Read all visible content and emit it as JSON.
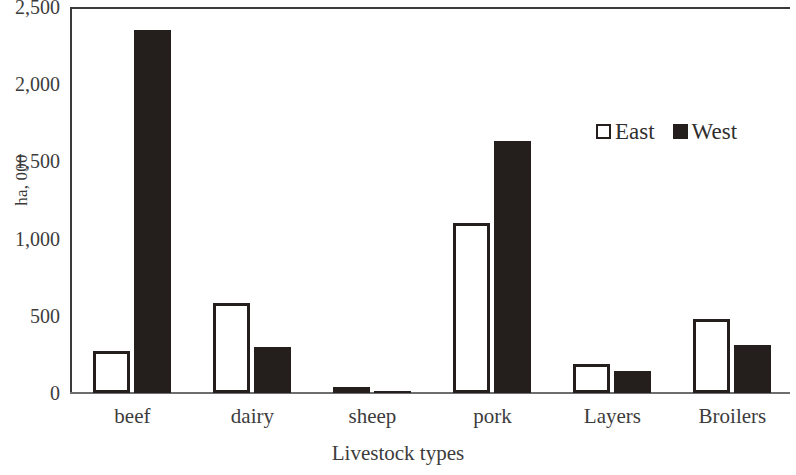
{
  "chart_data": {
    "type": "bar",
    "title": "",
    "xlabel": "Livestock types",
    "ylabel": "ha, 000",
    "categories": [
      "beef",
      "dairy",
      "sheep",
      "pork",
      "Layers",
      "Broilers"
    ],
    "series": [
      {
        "name": "East",
        "color": "#ffffff",
        "values": [
          270,
          580,
          15,
          1100,
          190,
          480
        ]
      },
      {
        "name": "West",
        "color": "#241f1c",
        "values": [
          2350,
          300,
          15,
          1630,
          145,
          310
        ]
      }
    ],
    "ylim": [
      0,
      2500
    ],
    "yticks": [
      0,
      500,
      1000,
      1500,
      2000,
      2500
    ],
    "ytick_labels": [
      "0",
      "500",
      "1,000",
      "1,500",
      "2,000",
      "2,500"
    ],
    "grid": false,
    "legend_position": "upper right",
    "legend_entries": [
      "East",
      "West"
    ]
  },
  "axis": {
    "y_title": "ha, 000",
    "x_title": "Livestock types"
  },
  "legend": {
    "east_label": "East",
    "west_label": "West",
    "east_swatch": "hollow-square-icon",
    "west_swatch": "filled-square-icon"
  }
}
